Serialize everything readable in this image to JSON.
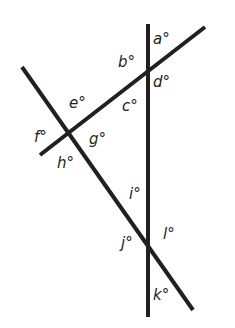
{
  "diagram": {
    "type": "geometry-angles",
    "line_color": "#231f20",
    "lines": [
      {
        "id": "vertical",
        "x1": 148,
        "y1": 24,
        "x2": 148,
        "y2": 317
      },
      {
        "id": "rising-diagonal",
        "x1": 40,
        "y1": 155,
        "x2": 205,
        "y2": 27
      },
      {
        "id": "falling-diagonal",
        "x1": 22,
        "y1": 67,
        "x2": 193,
        "y2": 310
      }
    ],
    "labels": {
      "a": "a°",
      "b": "b°",
      "c": "c°",
      "d": "d°",
      "e": "e°",
      "f": "f°",
      "g": "g°",
      "h": "h°",
      "i": "i°",
      "j": "j°",
      "k": "k°",
      "l": "l°"
    }
  }
}
